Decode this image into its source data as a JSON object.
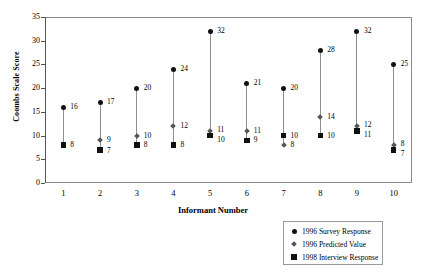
{
  "chart_data": {
    "type": "scatter",
    "title": "",
    "xlabel": "Informant Number",
    "ylabel": "Coombs Scale Score",
    "xlim": [
      0.5,
      10.5
    ],
    "ylim": [
      0,
      35
    ],
    "grid": false,
    "legend_position": "bottom-right",
    "categories": [
      "1",
      "2",
      "3",
      "4",
      "5",
      "6",
      "7",
      "8",
      "9",
      "10"
    ],
    "y_ticks": [
      "0",
      "5",
      "10",
      "15",
      "20",
      "25",
      "30",
      "35"
    ],
    "y_tick_values": [
      0,
      5,
      10,
      15,
      20,
      25,
      30,
      35
    ],
    "series": [
      {
        "name": "1996 Survey Response",
        "marker": "circle",
        "color": "#111111",
        "values": [
          16,
          17,
          20,
          24,
          32,
          21,
          20,
          28,
          32,
          25
        ]
      },
      {
        "name": "1996 Predicted Value",
        "marker": "diamond",
        "color": "#555555",
        "values": [
          null,
          9,
          10,
          12,
          11,
          11,
          8,
          14,
          12,
          8
        ]
      },
      {
        "name": "1998 Interview Response",
        "marker": "square",
        "color": "#111111",
        "values": [
          8,
          7,
          8,
          8,
          10,
          9,
          10,
          10,
          11,
          7
        ]
      }
    ],
    "point_labels": [
      {
        "x": 1,
        "series": "1996 Survey Response",
        "value": 16,
        "text": "16",
        "dx": 7,
        "dy": -4
      },
      {
        "x": 1,
        "series": "1998 Interview Response",
        "value": 8,
        "text": "8",
        "dx": 7,
        "dy": -4
      },
      {
        "x": 2,
        "series": "1996 Survey Response",
        "value": 17,
        "text": "17",
        "dx": 7,
        "dy": -4
      },
      {
        "x": 2,
        "series": "1996 Predicted Value",
        "value": 9,
        "text": "9",
        "dx": 7,
        "dy": -4
      },
      {
        "x": 2,
        "series": "1998 Interview Response",
        "value": 7,
        "text": "7",
        "dx": 7,
        "dy": -3
      },
      {
        "x": 3,
        "series": "1996 Survey Response",
        "value": 20,
        "text": "20",
        "dx": 7,
        "dy": -4
      },
      {
        "x": 3,
        "series": "1996 Predicted Value",
        "value": 10,
        "text": "10",
        "dx": 7,
        "dy": -4
      },
      {
        "x": 3,
        "series": "1998 Interview Response",
        "value": 8,
        "text": "8",
        "dx": 7,
        "dy": -4
      },
      {
        "x": 4,
        "series": "1996 Survey Response",
        "value": 24,
        "text": "24",
        "dx": 7,
        "dy": -4
      },
      {
        "x": 4,
        "series": "1996 Predicted Value",
        "value": 12,
        "text": "12",
        "dx": 7,
        "dy": -4
      },
      {
        "x": 4,
        "series": "1998 Interview Response",
        "value": 8,
        "text": "8",
        "dx": 7,
        "dy": -4
      },
      {
        "x": 5,
        "series": "1996 Survey Response",
        "value": 32,
        "text": "32",
        "dx": 7,
        "dy": -4
      },
      {
        "x": 5,
        "series": "1996 Predicted Value",
        "value": 11,
        "text": "11",
        "dx": 7,
        "dy": -5
      },
      {
        "x": 5,
        "series": "1998 Interview Response",
        "value": 10,
        "text": "10",
        "dx": 7,
        "dy": 0
      },
      {
        "x": 6,
        "series": "1996 Survey Response",
        "value": 21,
        "text": "21",
        "dx": 7,
        "dy": -4
      },
      {
        "x": 6,
        "series": "1996 Predicted Value",
        "value": 11,
        "text": "11",
        "dx": 7,
        "dy": -4
      },
      {
        "x": 6,
        "series": "1998 Interview Response",
        "value": 9,
        "text": "9",
        "dx": 7,
        "dy": -4
      },
      {
        "x": 7,
        "series": "1996 Survey Response",
        "value": 20,
        "text": "20",
        "dx": 7,
        "dy": -4
      },
      {
        "x": 7,
        "series": "1998 Interview Response",
        "value": 10,
        "text": "10",
        "dx": 7,
        "dy": -4
      },
      {
        "x": 7,
        "series": "1996 Predicted Value",
        "value": 8,
        "text": "8",
        "dx": 7,
        "dy": -4
      },
      {
        "x": 8,
        "series": "1996 Survey Response",
        "value": 28,
        "text": "28",
        "dx": 7,
        "dy": -4
      },
      {
        "x": 8,
        "series": "1996 Predicted Value",
        "value": 14,
        "text": "14",
        "dx": 7,
        "dy": -4
      },
      {
        "x": 8,
        "series": "1998 Interview Response",
        "value": 10,
        "text": "10",
        "dx": 7,
        "dy": -4
      },
      {
        "x": 9,
        "series": "1996 Survey Response",
        "value": 32,
        "text": "32",
        "dx": 7,
        "dy": -4
      },
      {
        "x": 9,
        "series": "1996 Predicted Value",
        "value": 12,
        "text": "12",
        "dx": 7,
        "dy": -5
      },
      {
        "x": 9,
        "series": "1998 Interview Response",
        "value": 11,
        "text": "11",
        "dx": 7,
        "dy": 0
      },
      {
        "x": 10,
        "series": "1996 Survey Response",
        "value": 25,
        "text": "25",
        "dx": 7,
        "dy": -4
      },
      {
        "x": 10,
        "series": "1996 Predicted Value",
        "value": 8,
        "text": "8",
        "dx": 7,
        "dy": -5
      },
      {
        "x": 10,
        "series": "1998 Interview Response",
        "value": 7,
        "text": "7",
        "dx": 7,
        "dy": 0
      }
    ]
  },
  "axes": {
    "y_title": "Coombs Scale Score",
    "x_title": "Informant Number"
  },
  "legend": {
    "items": [
      {
        "label": "1996 Survey Response",
        "marker": "circle"
      },
      {
        "label": "1996 Predicted Value",
        "marker": "diamond"
      },
      {
        "label": "1998 Interview Response",
        "marker": "square"
      }
    ]
  }
}
